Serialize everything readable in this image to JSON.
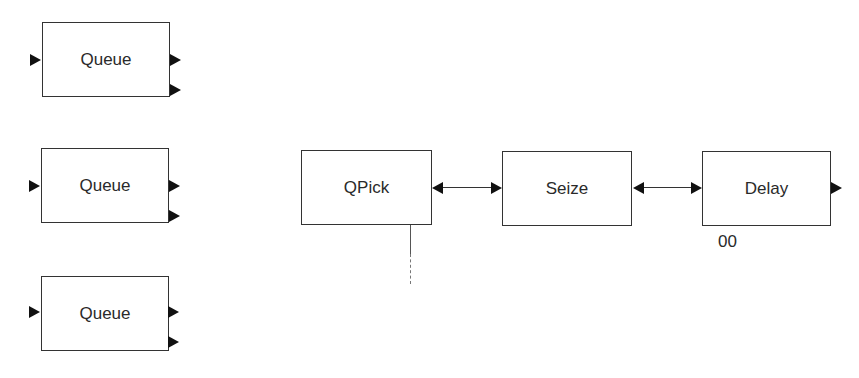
{
  "diagram": {
    "queues": [
      {
        "label": "Queue"
      },
      {
        "label": "Queue"
      },
      {
        "label": "Queue"
      }
    ],
    "chain": {
      "qpick": {
        "label": "QPick"
      },
      "seize": {
        "label": "Seize"
      },
      "delay": {
        "label": "Delay",
        "annotation": "00"
      }
    },
    "connectors": [
      {
        "from": "QPick",
        "to": "Seize",
        "type": "bidirectional"
      },
      {
        "from": "Seize",
        "to": "Delay",
        "type": "bidirectional"
      }
    ],
    "colors": {
      "stroke": "#333333",
      "arrow": "#111111",
      "background": "#ffffff"
    }
  }
}
